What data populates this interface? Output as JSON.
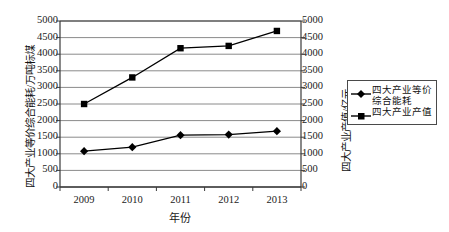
{
  "chart_data": {
    "type": "line",
    "title": "",
    "subtitle": "",
    "xlabel": "年份",
    "categories": [
      "2009",
      "2010",
      "2011",
      "2012",
      "2013"
    ],
    "x": [
      2009,
      2010,
      2011,
      2012,
      2013
    ],
    "grid": true,
    "legend_position": "right",
    "axes": {
      "left": {
        "label": "四大产业等价综合能耗/万吨标煤",
        "min": 0,
        "max": 5000,
        "step": 500,
        "ticks": [
          "0",
          "500",
          "1000",
          "1500",
          "2000",
          "2500",
          "3000",
          "3500",
          "4000",
          "4500",
          "5000"
        ]
      },
      "right": {
        "label": "四大产业产值/亿元",
        "min": 0,
        "max": 5000,
        "step": 500,
        "ticks": [
          "0",
          "500",
          "1000",
          "1500",
          "2000",
          "2500",
          "3000",
          "3500",
          "4000",
          "4500",
          "5000"
        ]
      }
    },
    "series": [
      {
        "name": "四大产业等价综合能耗",
        "legend_label": "四大产业等价\n综合能耗",
        "marker": "diamond",
        "axis": "left",
        "color": "#000000",
        "values": [
          1080,
          1200,
          1560,
          1580,
          1680
        ]
      },
      {
        "name": "四大产业产值",
        "legend_label": "四大产业产值",
        "marker": "square",
        "axis": "right",
        "color": "#000000",
        "values": [
          2500,
          3300,
          4180,
          4250,
          4700
        ]
      }
    ]
  },
  "legend": {
    "items": [
      {
        "label": "四大产业等价\n综合能耗",
        "marker": "diamond-marker"
      },
      {
        "label": "四大产业产值",
        "marker": "square-marker"
      }
    ]
  }
}
